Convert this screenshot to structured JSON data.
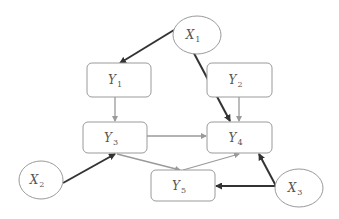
{
  "diagram": {
    "type": "path-diagram",
    "colors": {
      "background": "#ffffff",
      "node_stroke": "#9a9a9a",
      "text": "#555555",
      "strong_edge": "#333333",
      "weak_edge": "#9a9a9a"
    },
    "nodes": [
      {
        "id": "X1",
        "shape": "ellipse",
        "letter": "X",
        "sub": "1",
        "cx": 197,
        "cy": 35,
        "rx": 24,
        "ry": 19
      },
      {
        "id": "X2",
        "shape": "ellipse",
        "letter": "X",
        "sub": "2",
        "cx": 41,
        "cy": 180,
        "rx": 22,
        "ry": 19
      },
      {
        "id": "X3",
        "shape": "ellipse",
        "letter": "X",
        "sub": "3",
        "cx": 299,
        "cy": 188,
        "rx": 24,
        "ry": 19
      },
      {
        "id": "Y1",
        "shape": "rounded-rect",
        "letter": "Y",
        "sub": "1",
        "x": 87,
        "y": 63,
        "w": 64,
        "h": 34
      },
      {
        "id": "Y2",
        "shape": "rounded-rect",
        "letter": "Y",
        "sub": "2",
        "x": 207,
        "y": 63,
        "w": 65,
        "h": 34
      },
      {
        "id": "Y3",
        "shape": "rounded-rect",
        "letter": "Y",
        "sub": "3",
        "x": 83,
        "y": 122,
        "w": 64,
        "h": 31
      },
      {
        "id": "Y4",
        "shape": "rounded-rect",
        "letter": "Y",
        "sub": "4",
        "x": 207,
        "y": 122,
        "w": 65,
        "h": 31
      },
      {
        "id": "Y5",
        "shape": "rounded-rect",
        "letter": "Y",
        "sub": "5",
        "x": 151,
        "y": 170,
        "w": 64,
        "h": 31
      }
    ],
    "edges": [
      {
        "from": "X1",
        "to": "Y1",
        "style": "strong",
        "x1": 174,
        "y1": 30,
        "x2": 120,
        "y2": 63
      },
      {
        "from": "X1",
        "to": "Y4",
        "style": "strong",
        "x1": 188,
        "y1": 42,
        "x2": 230,
        "y2": 121
      },
      {
        "from": "X2",
        "to": "Y3",
        "style": "strong",
        "x1": 63,
        "y1": 183,
        "x2": 115,
        "y2": 154
      },
      {
        "from": "X3",
        "to": "Y5",
        "style": "strong",
        "x1": 276,
        "y1": 186,
        "x2": 216,
        "y2": 186
      },
      {
        "from": "X3",
        "to": "Y4",
        "style": "strong",
        "x1": 276,
        "y1": 186,
        "x2": 259,
        "y2": 154
      },
      {
        "from": "Y1",
        "to": "Y3",
        "style": "weak",
        "x1": 115,
        "y1": 97,
        "x2": 115,
        "y2": 121
      },
      {
        "from": "Y2",
        "to": "Y4",
        "style": "weak",
        "x1": 239,
        "y1": 97,
        "x2": 239,
        "y2": 121
      },
      {
        "from": "Y3",
        "to": "Y4",
        "style": "weak",
        "x1": 147,
        "y1": 136,
        "x2": 206,
        "y2": 136
      },
      {
        "from": "Y3",
        "to": "Y5",
        "style": "weak",
        "x1": 117,
        "y1": 154,
        "x2": 180,
        "y2": 170
      },
      {
        "from": "Y5",
        "to": "Y4",
        "style": "weak",
        "x1": 183,
        "y1": 170,
        "x2": 239,
        "y2": 154
      }
    ]
  }
}
